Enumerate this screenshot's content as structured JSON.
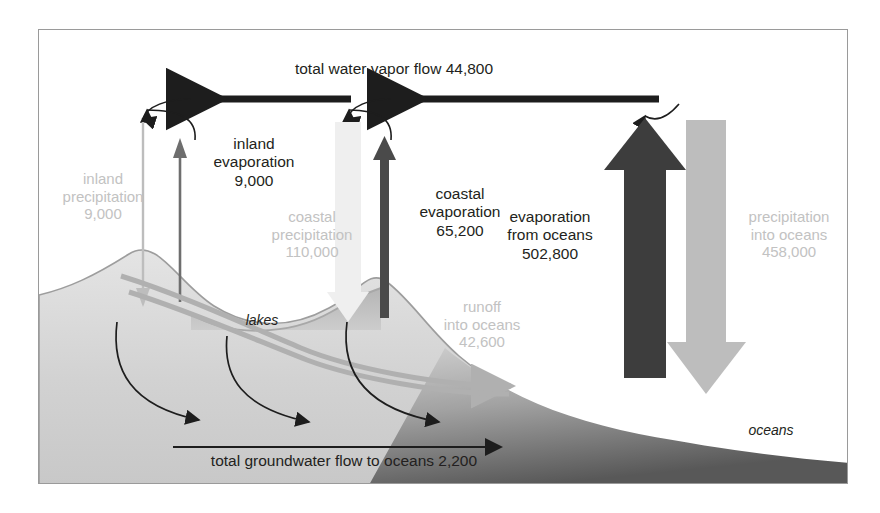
{
  "diagram": {
    "units_note": "",
    "colors": {
      "dark_arrow": "#3a3a3a",
      "light_arrow": "#b9b9b9",
      "pale_text": "#c2c2c2",
      "dark_text": "#231f20",
      "frame": "#9a9a9a",
      "land": "#d6d6d6",
      "ocean": "#9a9a9a",
      "lake": "#bdbdbd"
    },
    "labels": {
      "total_vapor_flow": "total water vapor flow 44,800",
      "inland_precipitation": "inland\nprecipitation\n9,000",
      "inland_evaporation": "inland\nevaporation\n9,000",
      "coastal_precipitation": "coastal\nprecipitation\n110,000",
      "coastal_evaporation": "coastal\nevaporation\n65,200",
      "evaporation_from_oceans": "evaporation\nfrom oceans\n502,800",
      "precipitation_into_oceans": "precipitation\ninto oceans\n458,000",
      "runoff_into_oceans": "runoff\ninto oceans\n42,600",
      "groundwater_flow": "total groundwater flow to oceans 2,200",
      "lakes": "lakes",
      "oceans": "oceans"
    },
    "flows": [
      {
        "name": "total water vapor flow",
        "value": "44,800",
        "direction": "horizontal-left",
        "style": "dark"
      },
      {
        "name": "inland precipitation",
        "value": "9,000",
        "direction": "down",
        "style": "light"
      },
      {
        "name": "inland evaporation",
        "value": "9,000",
        "direction": "up",
        "style": "dark"
      },
      {
        "name": "coastal precipitation",
        "value": "110,000",
        "direction": "down",
        "style": "light"
      },
      {
        "name": "coastal evaporation",
        "value": "65,200",
        "direction": "up",
        "style": "dark"
      },
      {
        "name": "evaporation from oceans",
        "value": "502,800",
        "direction": "up",
        "style": "dark"
      },
      {
        "name": "precipitation into oceans",
        "value": "458,000",
        "direction": "down",
        "style": "light"
      },
      {
        "name": "runoff into oceans",
        "value": "42,600",
        "direction": "right-down",
        "style": "light"
      },
      {
        "name": "total groundwater flow to oceans",
        "value": "2,200",
        "direction": "right",
        "style": "dark"
      }
    ]
  }
}
